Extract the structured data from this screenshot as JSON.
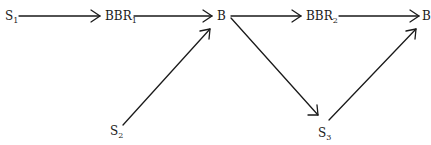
{
  "diagram": {
    "type": "flow",
    "nodes": [
      {
        "id": "S1",
        "label": "S",
        "sub": "1"
      },
      {
        "id": "BBR1",
        "label": "BBR",
        "sub": "1"
      },
      {
        "id": "B_a",
        "label": "B",
        "sub": ""
      },
      {
        "id": "S2",
        "label": "S",
        "sub": "2"
      },
      {
        "id": "BBR2",
        "label": "BBR",
        "sub": "2"
      },
      {
        "id": "B_b",
        "label": "B",
        "sub": ""
      },
      {
        "id": "S3",
        "label": "S",
        "sub": "3"
      }
    ],
    "edges": [
      {
        "from": "S1",
        "to": "BBR1"
      },
      {
        "from": "BBR1",
        "to": "B_a"
      },
      {
        "from": "S2",
        "to": "B_a"
      },
      {
        "from": "B_a",
        "to": "BBR2"
      },
      {
        "from": "BBR2",
        "to": "B_b"
      },
      {
        "from": "B_a",
        "to": "S3"
      },
      {
        "from": "S3",
        "to": "B_b"
      }
    ],
    "stroke_color": "#1a1a1a"
  }
}
